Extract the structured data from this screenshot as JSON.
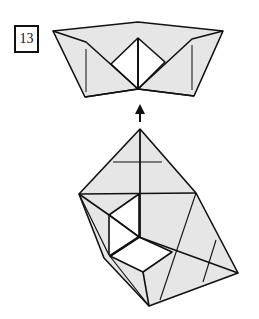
{
  "step_number": "13",
  "colors": {
    "paper_fill": "#e6e6e6",
    "line": "#111111",
    "background": "#ffffff"
  },
  "figures": [
    {
      "name": "result-shape",
      "description": "Folded boat-like shape with white diamond pocket in center"
    },
    {
      "name": "arrow",
      "description": "Upward arrow indicating transition to next state"
    },
    {
      "name": "current-shape",
      "description": "Folded model in perspective with white square openings"
    }
  ]
}
